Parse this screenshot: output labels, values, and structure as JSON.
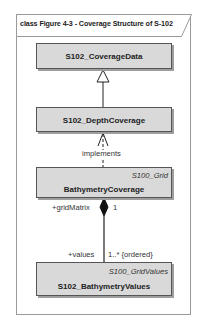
{
  "diagram": {
    "frame_title": "class Figure 4-3 - Coverage Structure of S-102",
    "classes": [
      {
        "id": "coverage-data",
        "name": "S102_CoverageData",
        "stereotype": ""
      },
      {
        "id": "depth-coverage",
        "name": "S102_DepthCoverage",
        "stereotype": ""
      },
      {
        "id": "bathymetry-coverage",
        "name": "BathymetryCoverage",
        "stereotype": "S100_Grid"
      },
      {
        "id": "bathymetry-values",
        "name": "S102_BathymetryValues",
        "stereotype": "S100_GridValues"
      }
    ],
    "relations": [
      {
        "type": "generalization",
        "from": "S102_DepthCoverage",
        "to": "S102_CoverageData"
      },
      {
        "type": "realization",
        "from": "BathymetryCoverage",
        "to": "S102_DepthCoverage",
        "label": "implements"
      },
      {
        "type": "composition",
        "from": "BathymetryCoverage",
        "to": "S102_BathymetryValues",
        "source_role": "+gridMatrix",
        "source_multiplicity": "1",
        "target_role": "+values",
        "target_multiplicity": "1..* {ordered}"
      }
    ],
    "colors": {
      "class_fill": "#d9d9d9",
      "class_border": "#555555",
      "frame_border": "#9a9a9a"
    }
  }
}
